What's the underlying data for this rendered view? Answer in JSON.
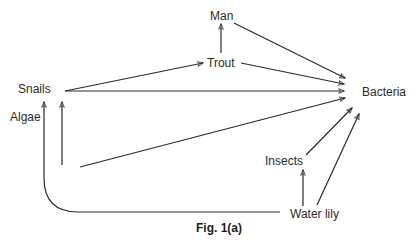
{
  "figure": {
    "caption": "Fig. 1(a)",
    "type": "food web"
  },
  "nodes": [
    {
      "id": "man",
      "label": "Man"
    },
    {
      "id": "trout",
      "label": "Trout"
    },
    {
      "id": "snails",
      "label": "Snails"
    },
    {
      "id": "algae",
      "label": "Algae"
    },
    {
      "id": "bacteria",
      "label": "Bacteria"
    },
    {
      "id": "insects",
      "label": "Insects"
    },
    {
      "id": "water_lily",
      "label": "Water lily"
    }
  ],
  "edges": [
    {
      "from": "trout",
      "to": "man"
    },
    {
      "from": "man",
      "to": "bacteria"
    },
    {
      "from": "trout",
      "to": "bacteria"
    },
    {
      "from": "snails",
      "to": "trout"
    },
    {
      "from": "snails",
      "to": "bacteria"
    },
    {
      "from": "algae",
      "to": "snails"
    },
    {
      "from": "algae",
      "to": "bacteria"
    },
    {
      "from": "water_lily",
      "to": "snails"
    },
    {
      "from": "water_lily",
      "to": "insects"
    },
    {
      "from": "water_lily",
      "to": "bacteria"
    },
    {
      "from": "insects",
      "to": "bacteria"
    }
  ],
  "colors": {
    "line": "#2a2a2a",
    "text": "#2a2a2a",
    "background": "#ffffff"
  }
}
